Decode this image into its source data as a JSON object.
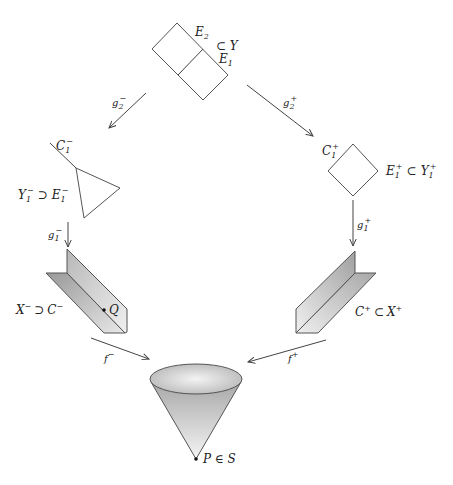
{
  "diagram": {
    "colors": {
      "stroke": "#444444",
      "text": "#222222",
      "shade_dark": "#a8a8a8",
      "shade_light": "#f2f2f2"
    },
    "nodes": {
      "top_square": {
        "label_E2": "E",
        "label_E2_sub": "2",
        "label_subset": "⊂ Y",
        "label_E1": "E",
        "label_E1_sub": "1"
      },
      "triangle_left": {
        "label_C": "C",
        "label_C_sub": "1",
        "label_C_sup": "−",
        "label_Y": "Y",
        "label_Y_sub": "1",
        "label_Y_sup": "−",
        "label_supset": "⊃",
        "label_E": "E",
        "label_E_sub": "1",
        "label_E_sup": "−"
      },
      "diamond_right": {
        "label_C": "C",
        "label_C_sub": "1",
        "label_C_sup": "+",
        "label_E": "E",
        "label_E_sub": "1",
        "label_E_sup": "+",
        "label_subset": "⊂",
        "label_Y": "Y",
        "label_Y_sub": "1",
        "label_Y_sup": "+"
      },
      "wedge_left": {
        "label_X": "X",
        "label_X_sup": "−",
        "label_supset": "⊃",
        "label_C": "C",
        "label_C_sup": "−",
        "point_label": "Q"
      },
      "wedge_right": {
        "label_C": "C",
        "label_C_sup": "+",
        "label_subset": "⊂",
        "label_X": "X",
        "label_X_sup": "+"
      },
      "cone": {
        "point_label": "P ∈ S"
      }
    },
    "arrows": {
      "g2_minus": {
        "label": "g",
        "sub": "2",
        "sup": "−"
      },
      "g2_plus": {
        "label": "g",
        "sub": "2",
        "sup": "+"
      },
      "g1_minus": {
        "label": "g",
        "sub": "1",
        "sup": "−"
      },
      "g1_plus": {
        "label": "g",
        "sub": "1",
        "sup": "+"
      },
      "f_minus": {
        "label": "f",
        "sup": "−"
      },
      "f_plus": {
        "label": "f",
        "sup": "+"
      }
    }
  }
}
